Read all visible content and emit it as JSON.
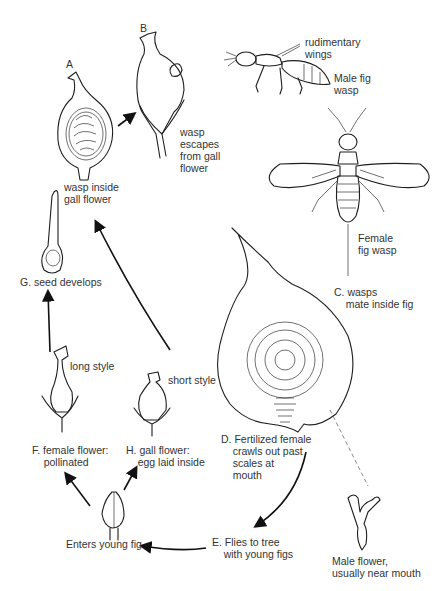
{
  "diagram": {
    "type": "life-cycle",
    "stages": [
      {
        "id": "A",
        "label": "A",
        "caption": "wasp inside\ngall flower"
      },
      {
        "id": "B",
        "label": "B",
        "caption": "wasp\nescapes\nfrom gall\nflower"
      },
      {
        "id": "C",
        "caption": "C. wasps\n    mate inside fig"
      },
      {
        "id": "D",
        "caption": "D. Fertilized female\n    crawls out past\n    scales at\n    mouth"
      },
      {
        "id": "E",
        "caption": "E. Flies to tree\n    with young figs"
      },
      {
        "id": "enter",
        "caption": "Enters young fig"
      },
      {
        "id": "F",
        "caption": "F. female flower:\n    pollinated"
      },
      {
        "id": "G",
        "caption": "G. seed develops"
      },
      {
        "id": "H",
        "caption": "H. gall flower:\n    egg laid inside"
      }
    ],
    "annotations": {
      "rudimentary_wings": "rudimentary\nwings",
      "male_wasp": "Male fig\nwasp",
      "female_wasp": "Female\nfig wasp",
      "long_style": "long style",
      "short_style": "short style",
      "male_flower": "Male flower,\nusually near mouth"
    },
    "flow": [
      "A -> B",
      "E -> Enters young fig",
      "Enters young fig -> F",
      "Enters young fig -> H",
      "F -> G",
      "H -> A",
      "D -> E"
    ],
    "colors": {
      "ink": "#1e1e1e",
      "background": "#ffffff"
    }
  }
}
